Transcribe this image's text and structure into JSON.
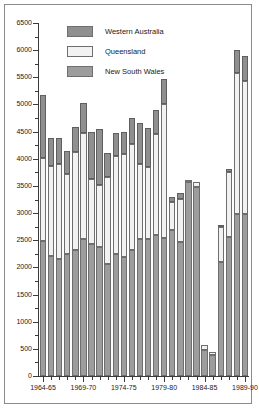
{
  "chart_data": {
    "type": "bar",
    "stacked": true,
    "title": "",
    "subtitle": "",
    "xlabel": "",
    "ylabel": "",
    "ylim": [
      0,
      6500
    ],
    "ytick_step": 500,
    "yticks": [
      0,
      500,
      1000,
      1500,
      2000,
      2500,
      3000,
      3500,
      4000,
      4500,
      5000,
      5500,
      6000,
      6500
    ],
    "ytick_labels": [
      "0",
      "500",
      "1000",
      "1500",
      "2000",
      "2500",
      "3000",
      "3500",
      "4000",
      "4500",
      "5000",
      "5500",
      "6000",
      "6500"
    ],
    "grid": false,
    "legend_position": "top-left-inside",
    "categories": [
      "1964-65",
      "1965-66",
      "1966-67",
      "1967-68",
      "1968-69",
      "1969-70",
      "1970-71",
      "1971-72",
      "1972-73",
      "1973-74",
      "1974-75",
      "1975-76",
      "1976-77",
      "1977-78",
      "1978-79",
      "1979-80",
      "1980-81",
      "1981-82",
      "1982-83",
      "1983-84",
      "1984-85",
      "1985-86",
      "1986-87",
      "1987-88",
      "1988-89",
      "1989-90"
    ],
    "xtick_labels_shown": [
      "1964-65",
      "1969-70",
      "1974-75",
      "1979-80",
      "1984-85",
      "1989-90"
    ],
    "xtick_label_indices": [
      0,
      5,
      10,
      15,
      20,
      25
    ],
    "series": [
      {
        "name": "New South Wales",
        "color": "#9d9d9d",
        "stack_order": 0,
        "values": [
          2480,
          2210,
          2150,
          2250,
          2320,
          2520,
          2440,
          2380,
          2060,
          2240,
          2200,
          2320,
          2530,
          2520,
          2600,
          2540,
          2680,
          2470,
          3570,
          3480,
          480,
          380,
          2100,
          2560,
          2980,
          2980
        ]
      },
      {
        "name": "Queensland",
        "color": "#f2f2f2",
        "stack_order": 1,
        "values": [
          1540,
          1660,
          1760,
          1470,
          1800,
          1960,
          1190,
          1140,
          1600,
          1810,
          1890,
          1960,
          1380,
          1320,
          1860,
          2470,
          520,
          790,
          30,
          90,
          90,
          60,
          640,
          1200,
          2600,
          2460
        ]
      },
      {
        "name": "Western Australia",
        "color": "#8f8f8f",
        "stack_order": 2,
        "values": [
          1150,
          510,
          480,
          430,
          460,
          550,
          860,
          1030,
          440,
          430,
          400,
          480,
          750,
          730,
          440,
          450,
          100,
          110,
          0,
          0,
          0,
          0,
          30,
          50,
          420,
          450
        ]
      }
    ],
    "totals": [
      5170,
      4380,
      4390,
      4150,
      4580,
      5030,
      4490,
      4550,
      4100,
      4480,
      4490,
      4760,
      4660,
      4570,
      4900,
      5460,
      3300,
      3370,
      3600,
      3570,
      570,
      440,
      2770,
      3810,
      6000,
      5890
    ]
  },
  "legend": {
    "items": [
      {
        "label": "Western Australia",
        "swatch": "#8f8f8f"
      },
      {
        "label": "Queensland",
        "swatch": "#f2f2f2"
      },
      {
        "label": "New South Wales",
        "swatch": "#9d9d9d"
      }
    ]
  }
}
